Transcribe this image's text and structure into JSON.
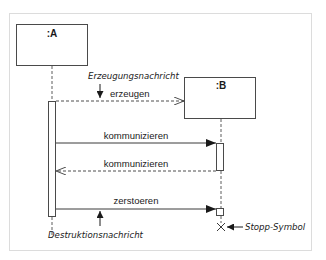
{
  "diagram": {
    "type": "uml-sequence",
    "objects": [
      {
        "id": "A",
        "label": ":A"
      },
      {
        "id": "B",
        "label": ":B"
      }
    ],
    "messages": [
      {
        "label": "erzeugen",
        "from": "A",
        "to": "B",
        "style": "dashed-open",
        "kind": "create"
      },
      {
        "label": "kommunizieren",
        "from": "A",
        "to": "B",
        "style": "solid-filled",
        "kind": "call"
      },
      {
        "label": "kommunizieren",
        "from": "B",
        "to": "A",
        "style": "dashed-open",
        "kind": "return"
      },
      {
        "label": "zerstoeren",
        "from": "A",
        "to": "B",
        "style": "solid-filled",
        "kind": "destroy"
      }
    ],
    "annotations": {
      "creation": "Erzeugungsnachricht",
      "destruction": "Destruktionsnachricht",
      "stop": "Stopp-Symbol"
    },
    "colors": {
      "line": "#3a3a3a",
      "frame": "#d8d8d8",
      "text": "#1a1a1a"
    }
  }
}
